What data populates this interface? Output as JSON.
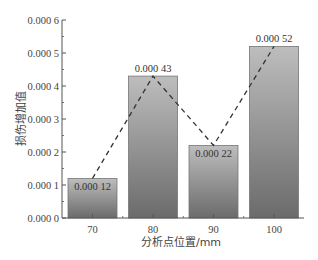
{
  "chart_data": {
    "type": "bar",
    "title": "",
    "categories": [
      "70",
      "80",
      "90",
      "100"
    ],
    "values": [
      0.00012,
      0.00043,
      0.00022,
      0.00052
    ],
    "data_labels": [
      "0.000 12",
      "0.000 43",
      "0.000 22",
      "0.000 52"
    ],
    "overlay_line": {
      "style": "dashed",
      "connects": "bar-tops",
      "values": [
        0.00012,
        0.00043,
        0.00022,
        0.00052
      ]
    },
    "xlabel": "分析点位置/mm",
    "ylabel": "损伤增加值",
    "ylim": [
      0,
      0.0006
    ],
    "yticks": [
      0,
      0.0001,
      0.0002,
      0.0003,
      0.0004,
      0.0005,
      0.0006
    ],
    "ytick_labels": [
      "0.000 0",
      "0.000 1",
      "0.000 2",
      "0.000 3",
      "0.000 4",
      "0.000 5",
      "0.000 6"
    ],
    "grid": false,
    "legend": null,
    "colors": {
      "bar_top": "#bdbdbd",
      "bar_bottom": "#6b6b6b",
      "bar_border": "#777777",
      "line": "#333333",
      "axis": "#555555"
    }
  }
}
